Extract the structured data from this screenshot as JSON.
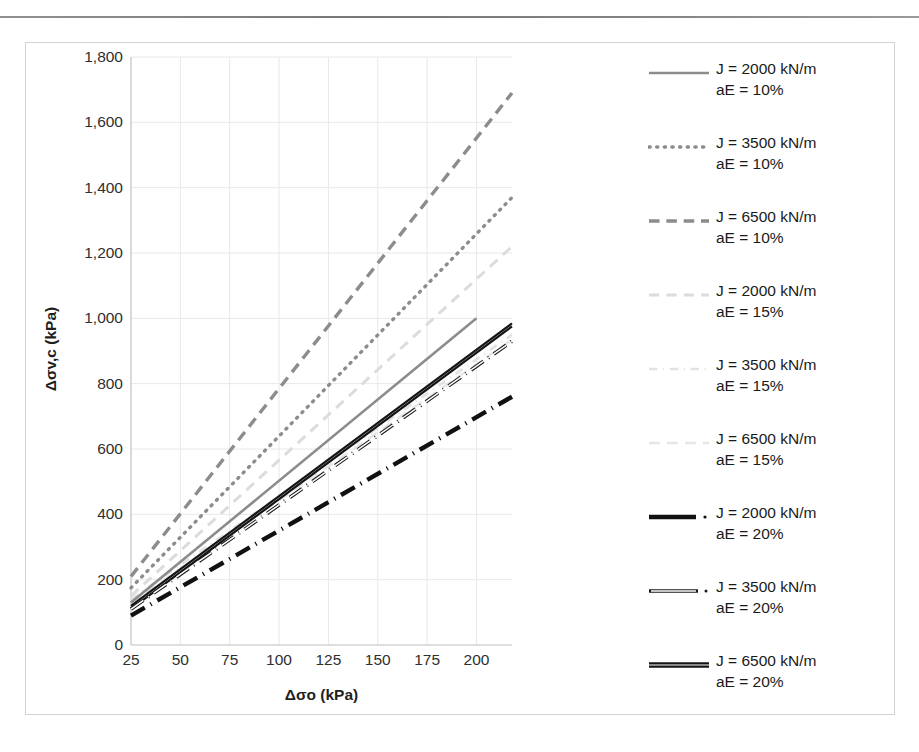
{
  "chart_data": {
    "type": "line",
    "title": "",
    "xlabel": "Δσo (kPa)",
    "ylabel": "Δσv,c (kPa)",
    "xlim": [
      25,
      218
    ],
    "ylim": [
      0,
      1800
    ],
    "grid": true,
    "legend_position": "right",
    "xticks": [
      "25",
      "50",
      "75",
      "100",
      "125",
      "150",
      "175",
      "200"
    ],
    "xtick_values": [
      25,
      50,
      75,
      100,
      125,
      150,
      175,
      200
    ],
    "yticks": [
      "0",
      "200",
      "400",
      "600",
      "800",
      "1,000",
      "1,200",
      "1,400",
      "1,600",
      "1,800"
    ],
    "ytick_values": [
      0,
      200,
      400,
      600,
      800,
      1000,
      1200,
      1400,
      1600,
      1800
    ],
    "series": [
      {
        "name": "J = 2000 kN/m aE = 10%",
        "label_line1": "J = 2000 kN/m",
        "label_line2": "aE = 10%",
        "style": "solid",
        "color": "#8c8c8c",
        "width": 2.6,
        "x": [
          25,
          200
        ],
        "values": [
          130,
          1000
        ]
      },
      {
        "name": "J = 3500 kN/m aE = 10%",
        "label_line1": "J = 3500 kN/m",
        "label_line2": "aE = 10%",
        "style": "dotted",
        "color": "#8c8c8c",
        "width": 3.4,
        "x": [
          25,
          218
        ],
        "values": [
          175,
          1370
        ]
      },
      {
        "name": "J = 6500 kN/m aE = 10%",
        "label_line1": "J = 6500 kN/m",
        "label_line2": "aE = 10%",
        "style": "dashed",
        "color": "#8c8c8c",
        "width": 3.4,
        "x": [
          25,
          218
        ],
        "values": [
          210,
          1690
        ]
      },
      {
        "name": "J = 2000 kN/m aE = 15%",
        "label_line1": "J = 2000 kN/m",
        "label_line2": "aE = 15%",
        "style": "dashed-light",
        "color": "#dcdcdc",
        "width": 3.0,
        "x": [
          25,
          218
        ],
        "values": [
          150,
          1220
        ]
      },
      {
        "name": "J = 3500 kN/m aE = 15%",
        "label_line1": "J = 3500 kN/m",
        "label_line2": "aE = 15%",
        "style": "dashdot-light",
        "color": "#e2e2e2",
        "width": 2.6,
        "x": [
          25,
          218
        ],
        "values": [
          140,
          950
        ]
      },
      {
        "name": "J = 6500 kN/m aE = 15%",
        "label_line1": "J = 6500 kN/m",
        "label_line2": "aE = 15%",
        "style": "longdash-light",
        "color": "#e6e6e6",
        "width": 2.4,
        "x": [
          25,
          218
        ],
        "values": [
          130,
          935
        ]
      },
      {
        "name": "J = 2000 kN/m aE = 20%",
        "label_line1": "J = 2000 kN/m",
        "label_line2": "aE = 20%",
        "style": "dashdot-heavy",
        "color": "#111111",
        "width": 4.4,
        "x": [
          25,
          218
        ],
        "values": [
          90,
          760
        ]
      },
      {
        "name": "J = 3500 kN/m aE = 20%",
        "label_line1": "J = 3500 kN/m",
        "label_line2": "aE = 20%",
        "style": "dashdot-outline",
        "color": "#1a1a1a",
        "width": 3.6,
        "x": [
          25,
          218
        ],
        "values": [
          110,
          930
        ]
      },
      {
        "name": "J = 6500 kN/m aE = 20%",
        "label_line1": "J = 6500 kN/m",
        "label_line2": "aE = 20%",
        "style": "solid-double",
        "color": "#141414",
        "width": 2.2,
        "x": [
          25,
          218
        ],
        "values": [
          115,
          980
        ]
      }
    ]
  },
  "axes": {
    "x_title": "Δσo (kPa)",
    "y_title": "Δσv,c (kPa)"
  },
  "legend": {
    "items": [
      {
        "line1": "J = 2000 kN/m",
        "line2": "aE = 10%"
      },
      {
        "line1": "J = 3500 kN/m",
        "line2": "aE = 10%"
      },
      {
        "line1": "J = 6500 kN/m",
        "line2": "aE = 10%"
      },
      {
        "line1": "J = 2000 kN/m",
        "line2": "aE = 15%"
      },
      {
        "line1": "J = 3500 kN/m",
        "line2": "aE = 15%"
      },
      {
        "line1": "J = 6500 kN/m",
        "line2": "aE = 15%"
      },
      {
        "line1": "J = 2000 kN/m",
        "line2": "aE = 20%"
      },
      {
        "line1": "J = 3500 kN/m",
        "line2": "aE = 20%"
      },
      {
        "line1": "J = 6500 kN/m",
        "line2": "aE = 20%"
      }
    ]
  },
  "colors": {
    "grid": "#e8e8e8",
    "axis": "#c9c9c9",
    "frame": "#d3d3d3",
    "text": "#2f2f2f"
  }
}
